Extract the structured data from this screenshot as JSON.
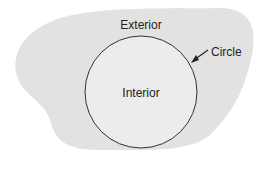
{
  "diagram": {
    "labels": {
      "exterior": "Exterior",
      "interior": "Interior",
      "circle": "Circle"
    },
    "colors": {
      "region_fill": "#e2e2e2",
      "interior_fill": "#ececec",
      "stroke": "#333333",
      "text": "#222222"
    },
    "circle": {
      "cx": 141,
      "cy": 92,
      "r": 56
    }
  }
}
